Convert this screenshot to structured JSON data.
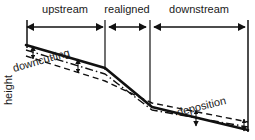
{
  "figure": {
    "background_color": "#ffffff",
    "ink_color": "#111111",
    "axis": {
      "ylabel": "height"
    },
    "zones": [
      {
        "id": "upstream",
        "label": "upstream",
        "label_x": 65,
        "label_y": 10,
        "arrow_x1": 27,
        "arrow_x2": 103,
        "arrow_y": 27,
        "divider_left_x": 27,
        "divider_right_x": 105
      },
      {
        "id": "realigned",
        "label": "realigned",
        "label_x": 127,
        "label_y": 10,
        "arrow_x1": 108,
        "arrow_x2": 147,
        "arrow_y": 27,
        "divider_left_x": 105,
        "divider_right_x": 150
      },
      {
        "id": "downstream",
        "label": "downstream",
        "label_x": 199,
        "label_y": 10,
        "arrow_x1": 153,
        "arrow_x2": 246,
        "arrow_y": 27,
        "divider_left_x": 150,
        "divider_right_x": 248
      }
    ],
    "dividers": [
      {
        "name": "left-edge-tick",
        "x": 27,
        "y1": 20,
        "y2": 48
      },
      {
        "name": "upstream-realigned-boundary",
        "x": 105,
        "y1": 20,
        "y2": 70
      },
      {
        "name": "realigned-downstream-boundary",
        "x": 150,
        "y1": 20,
        "y2": 105
      },
      {
        "name": "right-edge-tick",
        "x": 248,
        "y1": 20,
        "y2": 132
      }
    ],
    "profiles": [
      {
        "id": "original-profile",
        "name": "original channel bed profile",
        "style": "solid",
        "stroke_width": 2.6,
        "points": "26,45 105,68 152,107 248,130"
      },
      {
        "id": "intermediate-profile",
        "name": "intermediate adjusted profile",
        "style": "dash-dot",
        "stroke_width": 1.4,
        "points": "26,50 105,74 152,110 248,127"
      },
      {
        "id": "final-profile",
        "name": "final equilibrium profile",
        "style": "dashed",
        "stroke_width": 1.4,
        "points": "26,56 105,81 152,103 248,122"
      }
    ],
    "annotations": [
      {
        "id": "downcutting",
        "label": "downcutting",
        "x": 14,
        "y": 72,
        "rotation": -16
      },
      {
        "id": "deposition",
        "label": "deposition",
        "x": 178,
        "y": 116,
        "rotation": -14
      }
    ],
    "change_arrows": [
      {
        "name": "downcutting-arrow-left",
        "x": 33,
        "y1": 47,
        "y2": 58
      },
      {
        "name": "downcutting-arrow-right",
        "x": 78,
        "y1": 60,
        "y2": 72
      },
      {
        "name": "deposition-arrow-mid",
        "x": 196,
        "y1": 125,
        "y2": 110
      },
      {
        "name": "deposition-arrow-right",
        "x": 244,
        "y1": 130,
        "y2": 120
      }
    ],
    "ylabel_position": {
      "x": 12,
      "y": 105
    }
  }
}
